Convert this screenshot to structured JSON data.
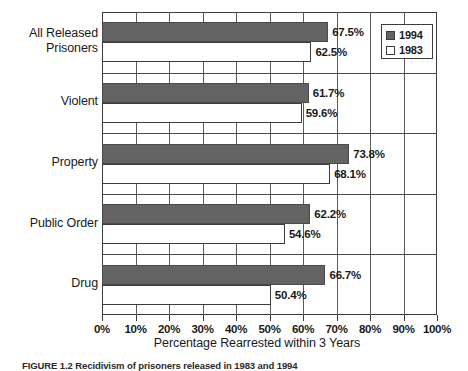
{
  "chart_data": {
    "type": "bar",
    "orientation": "horizontal",
    "title": "",
    "xlabel": "Percentage Rearrested within 3 Years",
    "ylabel": "",
    "xlim": [
      0,
      100
    ],
    "xticks": [
      "0%",
      "10%",
      "20%",
      "30%",
      "40%",
      "50%",
      "60%",
      "70%",
      "80%",
      "90%",
      "100%"
    ],
    "xtick_values": [
      0,
      10,
      20,
      30,
      40,
      50,
      60,
      70,
      80,
      90,
      100
    ],
    "grid": true,
    "grid_axis": "x",
    "legend_position": "top-right",
    "categories": [
      "All Released Prisoners",
      "Violent",
      "Property",
      "Public Order",
      "Drug"
    ],
    "series": [
      {
        "name": "1994",
        "color": "#636363",
        "values": [
          67.5,
          61.7,
          73.8,
          62.2,
          66.7
        ],
        "labels": [
          "67.5%",
          "61.7%",
          "73.8%",
          "62.2%",
          "66.7%"
        ]
      },
      {
        "name": "1983",
        "color": "#ffffff",
        "values": [
          62.5,
          59.6,
          68.1,
          54.6,
          50.4
        ],
        "labels": [
          "62.5%",
          "59.6%",
          "68.1%",
          "54.6%",
          "50.4%"
        ]
      }
    ]
  },
  "category_lines": [
    [
      "All Released",
      "Prisoners"
    ],
    [
      "Violent"
    ],
    [
      "Property"
    ],
    [
      "Public Order"
    ],
    [
      "Drug"
    ]
  ],
  "legend": {
    "items": [
      {
        "label": "1994",
        "swatch": "filled-dark"
      },
      {
        "label": "1983",
        "swatch": "outline-white"
      }
    ]
  },
  "caption": {
    "text": "FIGURE 1.2  Recidivism of prisoners released in 1983 and 1994"
  },
  "colors": {
    "bar_1994": "#636363",
    "bar_1983": "#ffffff",
    "frame": "#3d3d3d",
    "grid": "#5a5a5a",
    "text": "#1a1a1a",
    "background": "#ffffff"
  }
}
